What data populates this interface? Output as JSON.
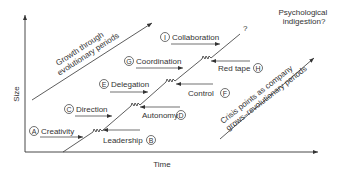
{
  "axes": {
    "x_label": "Time",
    "y_label": "Size"
  },
  "annotations": {
    "evolution": [
      "Growth through",
      "evolutionary periods"
    ],
    "revolution": [
      "Crisis points as company",
      "grows–revolutionary periods"
    ],
    "future": [
      "Psychological",
      "indigestion?"
    ],
    "question": "?"
  },
  "phases": [
    {
      "badge": "A",
      "label": "Creativity",
      "direction": "right"
    },
    {
      "badge": "B",
      "label": "Leadership",
      "direction": "left"
    },
    {
      "badge": "C",
      "label": "Direction",
      "direction": "right"
    },
    {
      "badge": "D",
      "label": "Autonomy",
      "direction": "left"
    },
    {
      "badge": "E",
      "label": "Delegation",
      "direction": "right"
    },
    {
      "badge": "F",
      "label": "Control",
      "direction": "left"
    },
    {
      "badge": "G",
      "label": "Coordination",
      "direction": "right"
    },
    {
      "badge": "H",
      "label": "Red tape",
      "direction": "left"
    },
    {
      "badge": "I",
      "label": "Collaboration",
      "direction": "right"
    }
  ],
  "colors": {
    "line": "#333333",
    "text": "#333333",
    "background": "#ffffff"
  }
}
